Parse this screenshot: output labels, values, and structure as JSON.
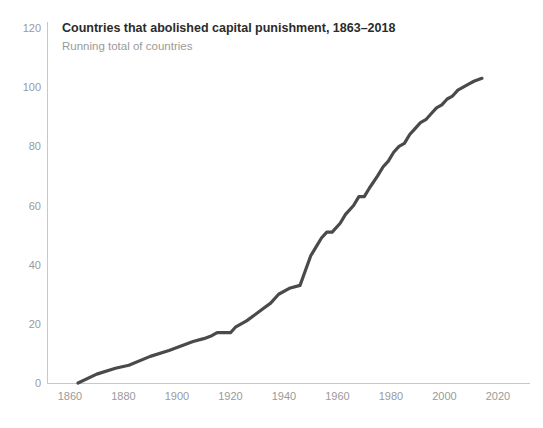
{
  "chart_data": {
    "type": "line",
    "title": "Countries that abolished capital punishment, 1863–2018",
    "subtitle": "Running total of countries",
    "xlabel": "",
    "ylabel": "",
    "xlim": [
      1855,
      2026
    ],
    "ylim": [
      0,
      120
    ],
    "grid": false,
    "legend": "none",
    "x_ticks": [
      "1860",
      "1880",
      "1900",
      "1920",
      "1940",
      "1960",
      "1980",
      "2000",
      "2020"
    ],
    "y_ticks": [
      "0",
      "20",
      "40",
      "60",
      "80",
      "100",
      "120"
    ],
    "series": [
      {
        "name": "Running total of countries",
        "color": "#4a4a4a",
        "x": [
          1863,
          1870,
          1877,
          1882,
          1890,
          1897,
          1903,
          1906,
          1910,
          1913,
          1915,
          1918,
          1920,
          1922,
          1926,
          1929,
          1932,
          1935,
          1938,
          1942,
          1946,
          1948,
          1950,
          1952,
          1954,
          1956,
          1958,
          1961,
          1963,
          1966,
          1968,
          1970,
          1972,
          1975,
          1977,
          1979,
          1981,
          1983,
          1985,
          1987,
          1989,
          1991,
          1993,
          1995,
          1997,
          1999,
          2001,
          2003,
          2005,
          2007,
          2009,
          2011,
          2014
        ],
        "values": [
          0,
          3,
          5,
          6,
          9,
          11,
          13,
          14,
          15,
          16,
          17,
          17,
          17,
          19,
          21,
          23,
          25,
          27,
          30,
          32,
          33,
          38,
          43,
          46,
          49,
          51,
          51,
          54,
          57,
          60,
          63,
          63,
          66,
          70,
          73,
          75,
          78,
          80,
          81,
          84,
          86,
          88,
          89,
          91,
          93,
          94,
          96,
          97,
          99,
          100,
          101,
          102,
          103
        ]
      }
    ]
  },
  "axes": {
    "axis_color": "#c8c8c8",
    "tick_label_color": "#9a9a9a"
  },
  "header": {
    "title_color": "#2b2b2b",
    "subtitle_color": "#9a9a9a"
  }
}
